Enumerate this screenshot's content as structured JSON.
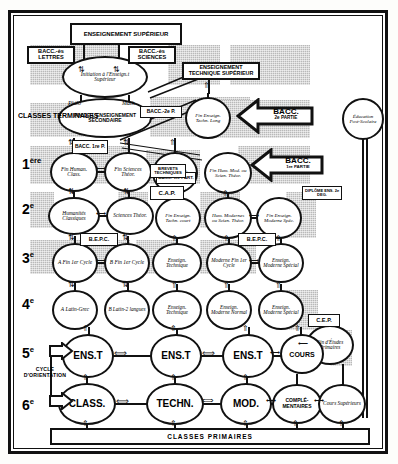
{
  "diagram": {
    "type": "flowchart"
  },
  "top_boxes": {
    "enseignement_superieur": "ENSEIGNEMENT SUPÉRIEUR",
    "enseignement_technique_superieur": "ENSEIGNEMENT TECHNIQUE SUPÉRIEUR",
    "bacc_lettres": "BACC.-ès LETTRES",
    "bacc_sciences": "BACC.-ès SCIENCES"
  },
  "levels": [
    {
      "label": "CLASSES TERMINALES",
      "sup": ""
    },
    {
      "label": "1",
      "sup": "ère"
    },
    {
      "label": "2",
      "sup": "e"
    },
    {
      "label": "3",
      "sup": "e"
    },
    {
      "label": "4",
      "sup": "e"
    },
    {
      "label": "5",
      "sup": "e"
    },
    {
      "label": "6",
      "sup": "e"
    }
  ],
  "cycle_label": "CYCLE D'ORIENTATION",
  "nodes": {
    "initiation": "Initiation à l'Enseign.t Supérieur",
    "philo": "Philo",
    "math": "Math",
    "fin_secondaire": "FIN DE L'ENSEIGNEMENT SECONDAIRE",
    "fin_ens_tech_long": "Fin Enseign. Techn. Long",
    "fin_human_class": "Fin Human. Class.",
    "fin_sciences_theor": "Fin Sciences Théor.",
    "fin_ens_tech_moyen": "Fin Enseign. Techn. Moyen",
    "fin_hum_mod_scien": "Fin Hum. Mod. ou Scien. Théor.",
    "humanites_classiques": "Humanités Classiques",
    "sciences_theor": "Sciences Théor.",
    "fin_ens_tech_court": "Fin Enseign. Techn. court",
    "hum_modernes": "Hum. Modernes ou Scien. Théor.",
    "fin_ens_moderne_spec": "Fin Enseign. Moderne Spéc.",
    "a_fin_1er_cycle": "A Fin 1er Cycle",
    "b_fin_1er_cycle": "B Fin 1er Cycle",
    "enseign_technique_3": "Enseign. Technique",
    "moderne_fin_1er_cycle": "Moderne Fin 1er Cycle",
    "enseign_moderne_special": "Enseign. Moderne Spécial",
    "a_latin_grec": "A Latin-Grec",
    "b_latin_2langues": "B Latin-2 langues",
    "enseign_technique_4": "Enseign. Technique",
    "enseign_moderne_normal": "Enseign. Moderne Normal",
    "enseign_moderne_special_4": "Enseign. Moderne Spécial",
    "fin_etudes_primaires": "Fin d'Études Primaires",
    "ens_5_a": "ENS.T",
    "ens_5_b": "ENS.T",
    "ens_5_c": "ENS.T",
    "cours_5": "COURS",
    "class_6": "CLASS.",
    "techn_6": "TECHN.",
    "mod_6": "MOD.",
    "complementaires_6": "COMPLÉ-MENTAIRES",
    "cours_superieurs": "Cours Supérieurs",
    "education_post_scolaire": "Éducation Post-Scolaire"
  },
  "diplomas": {
    "bacc_2e_p_small": "BACC.-2e P.",
    "bacc_1re_p_small": "BACC. 1re P.",
    "bacc_1re_part_small": "BACC. 1re PART.",
    "brevets_techniques": "BREVETS TECHNIQUES",
    "cap": "C.A.P.",
    "bepc_left": "B.E.P.C.",
    "bepc_right": "B.E.P.C.",
    "diplome_ens_2e_deg": "DIPLÔME ENS. 2e DEG.",
    "cep": "C.E.P."
  },
  "big_arrows": {
    "bacc_2e_partie": {
      "line1": "BACC.",
      "line2": "2e PARTIE"
    },
    "bacc_1re_partie": {
      "line1": "BACC.",
      "line2": "1re PARTIE"
    }
  },
  "bottom": {
    "classes_primaires": "CLASSES PRIMAIRES"
  },
  "colors": {
    "ink": "#111111",
    "paper": "#ffffff",
    "shade": "#b9b9b9"
  }
}
